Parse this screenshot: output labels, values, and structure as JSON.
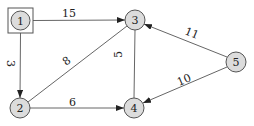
{
  "graph": {
    "nodes": [
      {
        "id": "1",
        "label": "1",
        "x": 20.5,
        "y": 20.5,
        "boxed": true
      },
      {
        "id": "2",
        "label": "2",
        "x": 20,
        "y": 108
      },
      {
        "id": "3",
        "label": "3",
        "x": 135,
        "y": 20
      },
      {
        "id": "4",
        "label": "4",
        "x": 134,
        "y": 108
      },
      {
        "id": "5",
        "label": "5",
        "x": 236,
        "y": 62
      }
    ],
    "edges": [
      {
        "from": "1",
        "to": "3",
        "weight": "15"
      },
      {
        "from": "1",
        "to": "2",
        "weight": "3"
      },
      {
        "from": "2",
        "to": "3",
        "weight": "8"
      },
      {
        "from": "2",
        "to": "4",
        "weight": "6"
      },
      {
        "from": "3",
        "to": "4",
        "weight": "5"
      },
      {
        "from": "5",
        "to": "3",
        "weight": "11"
      },
      {
        "from": "5",
        "to": "4",
        "weight": "10"
      }
    ]
  },
  "colors": {
    "node_fill": "#dcdcdc",
    "stroke": "#555555"
  }
}
